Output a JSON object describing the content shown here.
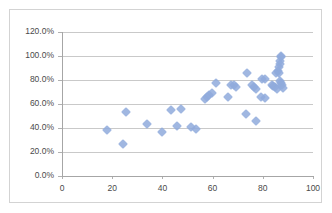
{
  "chart_data": {
    "type": "scatter",
    "title": "",
    "xlabel": "",
    "ylabel": "",
    "xlim": [
      0,
      100
    ],
    "ylim": [
      0,
      1.2
    ],
    "grid": true,
    "legend": false,
    "marker_color": "#8faadc",
    "marker_shape": "diamond",
    "x_tick_labels": [
      "0",
      "20",
      "40",
      "60",
      "80",
      "100"
    ],
    "x_tick_values": [
      0,
      20,
      40,
      60,
      80,
      100
    ],
    "y_tick_labels": [
      "0.0%",
      "20.0%",
      "40.0%",
      "60.0%",
      "80.0%",
      "100.0%",
      "120.0%"
    ],
    "y_tick_values": [
      0,
      0.2,
      0.4,
      0.6,
      0.8,
      1.0,
      1.2
    ],
    "points": [
      {
        "x": 17.8,
        "y": 0.385
      },
      {
        "x": 24.2,
        "y": 0.265
      },
      {
        "x": 25.6,
        "y": 0.535
      },
      {
        "x": 33.8,
        "y": 0.432
      },
      {
        "x": 39.8,
        "y": 0.368
      },
      {
        "x": 43.6,
        "y": 0.553
      },
      {
        "x": 45.8,
        "y": 0.418
      },
      {
        "x": 47.4,
        "y": 0.558
      },
      {
        "x": 51.4,
        "y": 0.405
      },
      {
        "x": 53.2,
        "y": 0.393
      },
      {
        "x": 56.8,
        "y": 0.638
      },
      {
        "x": 57.6,
        "y": 0.655
      },
      {
        "x": 58.6,
        "y": 0.678
      },
      {
        "x": 59.6,
        "y": 0.688
      },
      {
        "x": 61.4,
        "y": 0.778
      },
      {
        "x": 66.2,
        "y": 0.66
      },
      {
        "x": 67.4,
        "y": 0.762
      },
      {
        "x": 68.6,
        "y": 0.758
      },
      {
        "x": 69.4,
        "y": 0.738
      },
      {
        "x": 73.8,
        "y": 0.858
      },
      {
        "x": 73.4,
        "y": 0.518
      },
      {
        "x": 75.8,
        "y": 0.755
      },
      {
        "x": 76.6,
        "y": 0.74
      },
      {
        "x": 77.4,
        "y": 0.728
      },
      {
        "x": 77.2,
        "y": 0.458
      },
      {
        "x": 79.8,
        "y": 0.808
      },
      {
        "x": 81.0,
        "y": 0.812
      },
      {
        "x": 79.4,
        "y": 0.655
      },
      {
        "x": 80.8,
        "y": 0.648
      },
      {
        "x": 83.6,
        "y": 0.758
      },
      {
        "x": 84.2,
        "y": 0.752
      },
      {
        "x": 85.0,
        "y": 0.745
      },
      {
        "x": 85.6,
        "y": 0.728
      },
      {
        "x": 85.2,
        "y": 0.862
      },
      {
        "x": 86.0,
        "y": 0.872
      },
      {
        "x": 86.4,
        "y": 0.858
      },
      {
        "x": 86.6,
        "y": 0.905
      },
      {
        "x": 86.8,
        "y": 0.935
      },
      {
        "x": 87.0,
        "y": 0.962
      },
      {
        "x": 87.2,
        "y": 0.988
      },
      {
        "x": 87.4,
        "y": 1.0
      },
      {
        "x": 87.0,
        "y": 0.795
      },
      {
        "x": 87.4,
        "y": 0.775
      },
      {
        "x": 87.8,
        "y": 0.76
      },
      {
        "x": 88.0,
        "y": 0.735
      }
    ]
  }
}
